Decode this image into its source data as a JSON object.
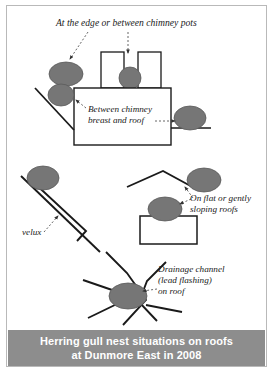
{
  "figure": {
    "title_caption": {
      "line1": "Herring gull nest situations on roofs",
      "line2": "at Dunmore East in 2008",
      "band_color": "#8d8d8d",
      "text_color": "#ffffff"
    },
    "border_color": "#b9b9b9",
    "background_color": "#ffffff"
  },
  "annotations": [
    {
      "id": "chimney-pots",
      "text": "At the edge or between chimney pots",
      "lines": [
        "At the edge or between chimney pots"
      ],
      "leader_count": 2
    },
    {
      "id": "chimney-breast",
      "text": "Between chimney breast and roof",
      "lines": [
        "Between chimney",
        "breast and roof"
      ],
      "leader_count": 2
    },
    {
      "id": "flat-roof",
      "text": "On flat or gently sloping roofs",
      "lines": [
        "On flat or gently",
        "sloping roofs"
      ],
      "leader_count": 2
    },
    {
      "id": "velux",
      "text": "velux",
      "lines": [
        "velux"
      ],
      "leader_count": 1
    },
    {
      "id": "drainage",
      "text": "Drainage channel (lead flashing) on roof",
      "lines": [
        "Drainage channel",
        "(lead flashing)",
        "on roof"
      ],
      "leader_count": 1
    }
  ],
  "styles": {
    "gull_fill": "#767676",
    "gull_stroke": "#5a5a5a",
    "structure_stroke": "#1a1a1a",
    "structure_fill": "#ffffff",
    "leader_stroke": "#555555"
  },
  "scene": {
    "gull_count": 8,
    "elements": [
      "two chimney pots on chimney stack",
      "chimney breast with roof slopes",
      "pitched roof apex",
      "flat roof block",
      "sloping roof with velux skylight",
      "drainage channel valley on roof"
    ]
  }
}
